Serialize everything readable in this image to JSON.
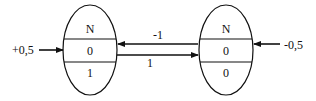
{
  "diagram": {
    "nodes": [
      {
        "id": "left",
        "cells": [
          "N",
          "0",
          "1"
        ],
        "external_input": "+0,5"
      },
      {
        "id": "right",
        "cells": [
          "N",
          "0",
          "0"
        ],
        "external_input": "-0,5"
      }
    ],
    "edges": [
      {
        "from": "right",
        "to": "left",
        "label": "-1"
      },
      {
        "from": "left",
        "to": "right",
        "label": "1"
      }
    ],
    "colors": {
      "stroke": "#111111",
      "background": "#ffffff"
    }
  }
}
